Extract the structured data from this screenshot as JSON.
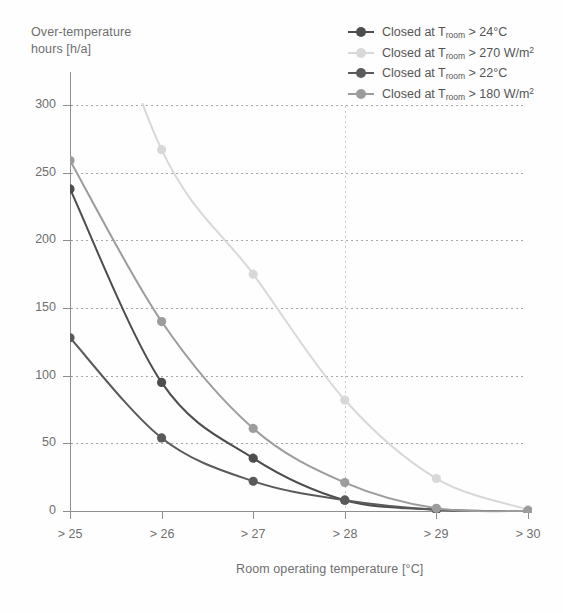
{
  "chart_data": {
    "type": "line",
    "title": "",
    "ylabel": "Over-temperature\nhours [h/a]",
    "xlabel": "Room operating temperature [°C]",
    "categories": [
      "> 25",
      "> 26",
      "> 27",
      "> 28",
      "> 29",
      "> 30"
    ],
    "x": [
      25,
      26,
      27,
      28,
      29,
      30
    ],
    "ylim": [
      0,
      300
    ],
    "xlim": [
      25,
      30
    ],
    "yticks": [
      0,
      50,
      100,
      150,
      200,
      250,
      300
    ],
    "grid": "horizontal-dotted",
    "legend_position": "top-right",
    "series": [
      {
        "name": "Closed at T_room > 24°C",
        "label_main": "Closed at T",
        "label_sub": "room",
        "label_tail": " > 24°C",
        "color": "#4d4d4d",
        "values": [
          238,
          95,
          39,
          8,
          1,
          0
        ]
      },
      {
        "name": "Closed at T_room > 270 W/m2",
        "label_main": "Closed at T",
        "label_sub": "room",
        "label_tail": " > 270 W/m",
        "label_sup": "2",
        "color": "#d8d8d8",
        "values": [
          460,
          267,
          175,
          82,
          24,
          1
        ]
      },
      {
        "name": "Closed at T_room > 22°C",
        "label_main": "Closed at T",
        "label_sub": "room",
        "label_tail": " > 22°C",
        "color": "#5a5a5a",
        "values": [
          128,
          54,
          22,
          8,
          1,
          0
        ]
      },
      {
        "name": "Closed at T_room > 180 W/m2",
        "label_main": "Closed at T",
        "label_sub": "room",
        "label_tail": " > 180 W/m",
        "label_sup": "2",
        "color": "#9c9c9c",
        "values": [
          259,
          140,
          61,
          21,
          2,
          0
        ]
      }
    ]
  },
  "axes": {
    "y_title": "Over-temperature\nhours [h/a]",
    "x_title": "Room operating temperature [°C]",
    "y_tick_labels": [
      "0",
      "50",
      "100",
      "150",
      "200",
      "250",
      "300"
    ],
    "x_tick_labels": [
      "> 25",
      "> 26",
      "> 27",
      "> 28",
      "> 29",
      "> 30"
    ]
  }
}
